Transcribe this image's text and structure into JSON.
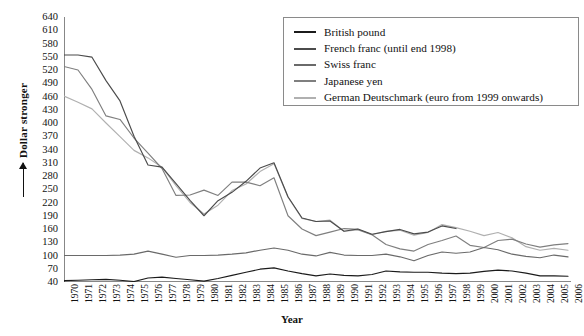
{
  "chart_data": {
    "type": "line",
    "title": "",
    "xlabel": "Year",
    "ylabel": "Dollar stronger",
    "ylim": [
      40,
      640
    ],
    "ytick_step": 30,
    "yticks": [
      640,
      610,
      580,
      550,
      520,
      490,
      460,
      430,
      400,
      370,
      340,
      310,
      280,
      250,
      220,
      190,
      160,
      130,
      100,
      70,
      40
    ],
    "grid": false,
    "legend_position": "top-right",
    "x": [
      1970,
      1971,
      1972,
      1973,
      1974,
      1975,
      1976,
      1977,
      1978,
      1979,
      1980,
      1981,
      1982,
      1983,
      1984,
      1985,
      1986,
      1987,
      1988,
      1989,
      1990,
      1991,
      1992,
      1993,
      1994,
      1995,
      1996,
      1997,
      1998,
      1999,
      2000,
      2001,
      2002,
      2003,
      2004,
      2005,
      2006
    ],
    "xticks": [
      "1970",
      "1971",
      "1972",
      "1973",
      "1974",
      "1975",
      "1976",
      "1977",
      "1978",
      "1979",
      "1980",
      "1981",
      "1982",
      "1983",
      "1984",
      "1985",
      "1986",
      "1987",
      "1988",
      "1989",
      "1990",
      "1991",
      "1992",
      "1993",
      "1994",
      "1995",
      "1996",
      "1997",
      "1998",
      "1999",
      "2000",
      "2001",
      "2002",
      "2003",
      "2004",
      "2005",
      "2006"
    ],
    "series": [
      {
        "name": "British pound",
        "color": "#1b1b1b",
        "values": [
          43,
          44,
          45,
          46,
          44,
          41,
          49,
          51,
          48,
          45,
          42,
          48,
          55,
          62,
          69,
          72,
          65,
          59,
          54,
          58,
          55,
          54,
          57,
          65,
          63,
          62,
          62,
          60,
          59,
          60,
          64,
          67,
          65,
          60,
          54,
          54,
          53
        ]
      },
      {
        "name": "French franc (until end 1998)",
        "color": "#4b4b4b",
        "values": [
          554,
          554,
          549,
          496,
          450,
          370,
          305,
          300,
          263,
          225,
          190,
          224,
          243,
          268,
          298,
          310,
          233,
          185,
          177,
          178,
          155,
          160,
          148,
          154,
          159,
          149,
          153,
          167,
          161,
          null,
          null,
          null,
          null,
          null,
          null,
          null,
          null
        ]
      },
      {
        "name": "Swiss franc",
        "color": "#6a6a6a",
        "values": [
          100,
          100,
          100,
          100,
          101,
          103,
          110,
          103,
          96,
          100,
          100,
          101,
          103,
          106,
          112,
          117,
          112,
          103,
          99,
          107,
          101,
          100,
          100,
          103,
          97,
          88,
          100,
          108,
          105,
          108,
          118,
          113,
          103,
          98,
          95,
          101,
          97
        ]
      },
      {
        "name": "Japanese yen",
        "color": "#7f7f7f",
        "values": [
          528,
          520,
          476,
          416,
          408,
          366,
          332,
          297,
          236,
          237,
          248,
          236,
          266,
          266,
          258,
          276,
          190,
          160,
          145,
          153,
          161,
          159,
          147,
          125,
          115,
          110,
          125,
          134,
          144,
          123,
          118,
          134,
          137,
          126,
          119,
          124,
          127
        ]
      },
      {
        "name": "German Deutschmark (euro from 1999 onwards)",
        "color": "#b0b0b0",
        "values": [
          461,
          447,
          432,
          400,
          369,
          338,
          321,
          300,
          258,
          220,
          194,
          214,
          247,
          262,
          290,
          308,
          232,
          184,
          177,
          180,
          155,
          158,
          147,
          155,
          157,
          146,
          152,
          170,
          163,
          155,
          145,
          152,
          140,
          120,
          112,
          116,
          112
        ]
      }
    ]
  },
  "legend": {
    "entries": [
      {
        "label": "British pound",
        "color": "#1b1b1b"
      },
      {
        "label": "French franc (until end 1998)",
        "color": "#4b4b4b"
      },
      {
        "label": "Swiss franc",
        "color": "#6a6a6a"
      },
      {
        "label": "Japanese yen",
        "color": "#7f7f7f"
      },
      {
        "label": "German Deutschmark (euro from 1999 onwards)",
        "color": "#b0b0b0"
      }
    ]
  },
  "axes": {
    "y_title": "Dollar stronger",
    "x_title": "Year"
  },
  "colors": {
    "axis": "#111111",
    "legend_border": "#8a8a8a",
    "background": "#ffffff"
  }
}
